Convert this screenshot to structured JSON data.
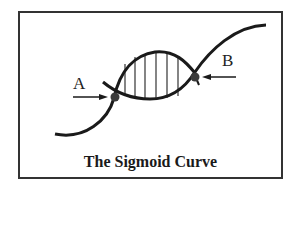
{
  "diagram": {
    "caption": "The Sigmoid Curve",
    "labels": {
      "point_a": "A",
      "point_b": "B"
    },
    "colors": {
      "line": "#1a1a1a",
      "frame": "#333333",
      "dot": "#3a3a3a",
      "background": "#ffffff"
    }
  }
}
